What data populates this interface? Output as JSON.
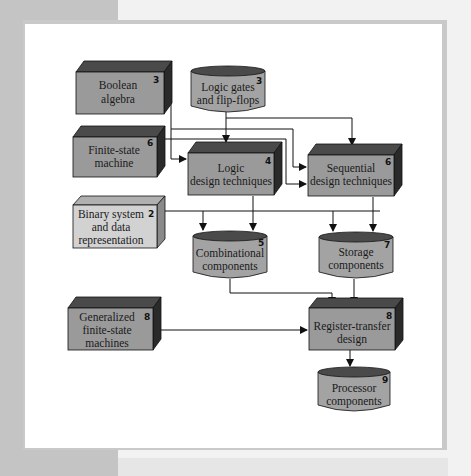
{
  "diagram": {
    "nodes": [
      {
        "id": "boolean",
        "shape": "box",
        "lines": [
          "Boolean",
          "algebra"
        ],
        "chapter": "3"
      },
      {
        "id": "gates",
        "shape": "cylinder",
        "lines": [
          "Logic gates",
          "and flip-flops"
        ],
        "chapter": "3"
      },
      {
        "id": "fsm",
        "shape": "box",
        "lines": [
          "Finite-state",
          "machine"
        ],
        "chapter": "6"
      },
      {
        "id": "logic",
        "shape": "box",
        "lines": [
          "Logic",
          "design techniques"
        ],
        "chapter": "4"
      },
      {
        "id": "seq",
        "shape": "box",
        "lines": [
          "Sequential",
          "design techniques"
        ],
        "chapter": "6"
      },
      {
        "id": "binary",
        "shape": "box-light",
        "lines": [
          "Binary system",
          "and data",
          "representation"
        ],
        "chapter": "2"
      },
      {
        "id": "comb",
        "shape": "cylinder",
        "lines": [
          "Combinational",
          "components"
        ],
        "chapter": "5"
      },
      {
        "id": "storage",
        "shape": "cylinder",
        "lines": [
          "Storage",
          "components"
        ],
        "chapter": "7"
      },
      {
        "id": "gfsm",
        "shape": "box",
        "lines": [
          "Generalized",
          "finite-state",
          "machines"
        ],
        "chapter": "8"
      },
      {
        "id": "rtl",
        "shape": "box",
        "lines": [
          "Register-transfer",
          "design"
        ],
        "chapter": "8"
      },
      {
        "id": "proc",
        "shape": "cylinder",
        "lines": [
          "Processor",
          "components"
        ],
        "chapter": "9"
      }
    ],
    "edges": [
      {
        "from": "gates",
        "to": "logic"
      },
      {
        "from": "gates",
        "to": "seq"
      },
      {
        "from": "boolean",
        "to": "logic"
      },
      {
        "from": "boolean",
        "to": "seq"
      },
      {
        "from": "fsm",
        "to": "seq"
      },
      {
        "from": "logic",
        "to": "comb"
      },
      {
        "from": "logic",
        "to": "storage"
      },
      {
        "from": "seq",
        "to": "storage"
      },
      {
        "from": "binary",
        "to": "comb"
      },
      {
        "from": "binary",
        "to": "storage"
      },
      {
        "from": "comb",
        "to": "rtl"
      },
      {
        "from": "storage",
        "to": "rtl"
      },
      {
        "from": "gfsm",
        "to": "rtl"
      },
      {
        "from": "rtl",
        "to": "proc"
      }
    ],
    "colors": {
      "box_front": "#9a9a9a",
      "box_top": "#4a4a4a",
      "box_side": "#2a2a2a",
      "box_light_front": "#d2d2d2",
      "box_light_top": "#b0b0b0",
      "box_light_side": "#8a8a8a",
      "cylinder_body": "#a3a3a3",
      "cylinder_top": "#4a4a4a",
      "line": "#111111"
    }
  }
}
